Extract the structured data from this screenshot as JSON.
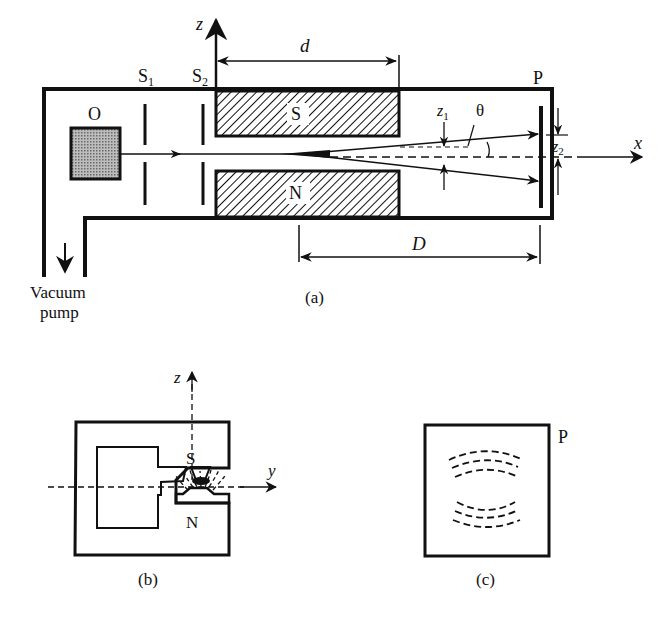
{
  "figure": {
    "panels": [
      {
        "id": "a",
        "caption": "(a)"
      },
      {
        "id": "b",
        "caption": "(b)"
      },
      {
        "id": "c",
        "caption": "(c)"
      }
    ]
  },
  "panel_a": {
    "oven_label": "O",
    "slit1_label": "S",
    "slit1_sub": "1",
    "slit2_label": "S",
    "slit2_sub": "2",
    "magnet_top_label": "S",
    "magnet_bottom_label": "N",
    "plate_label": "P",
    "axis_z": "z",
    "axis_x": "x",
    "dim_d": "d",
    "dim_D": "D",
    "z1_label": "z",
    "z1_sub": "1",
    "z2_label": "z",
    "z2_sub": "2",
    "theta_label": "θ",
    "pump_label_line1": "Vacuum",
    "pump_label_line2": "pump",
    "caption": "(a)"
  },
  "panel_b": {
    "axis_z": "z",
    "axis_y": "y",
    "pole_top": "S",
    "pole_bottom": "N",
    "caption": "(b)"
  },
  "panel_c": {
    "plate_label": "P",
    "caption": "(c)"
  },
  "colors": {
    "ink": "#111111",
    "oven_fill": "#9a9a9a",
    "background": "#ffffff"
  }
}
